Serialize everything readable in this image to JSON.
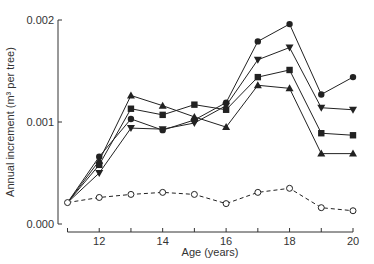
{
  "chart_data": {
    "type": "line",
    "title": "",
    "xlabel": "Age (years)",
    "ylabel": "Annual increment (m³ per tree)",
    "xlim": [
      11,
      20
    ],
    "ylim": [
      0.0,
      0.002
    ],
    "x": [
      11,
      12,
      13,
      14,
      15,
      16,
      17,
      18,
      19,
      20
    ],
    "x_ticks": [
      11,
      12,
      13,
      14,
      15,
      16,
      17,
      18,
      19,
      20
    ],
    "x_tick_labels": [
      "12",
      "14",
      "16",
      "18",
      "20"
    ],
    "y_ticks": [
      0.0,
      0.001,
      0.002
    ],
    "y_tick_labels": [
      "0.000",
      "0.001",
      "0.002"
    ],
    "grid": false,
    "legend": null,
    "series": [
      {
        "name": "filled circle",
        "marker": "circle-filled",
        "line": "solid",
        "values": [
          0.00021,
          0.00066,
          0.00103,
          0.00092,
          0.00102,
          0.00119,
          0.00179,
          0.00196,
          0.00127,
          0.00144
        ]
      },
      {
        "name": "filled triangle down",
        "marker": "triangle-down-filled",
        "line": "solid",
        "values": [
          0.00021,
          0.0005,
          0.00094,
          0.00093,
          0.00099,
          0.00116,
          0.00161,
          0.00173,
          0.00114,
          0.00112
        ]
      },
      {
        "name": "filled square",
        "marker": "square-filled",
        "line": "solid",
        "values": [
          0.00021,
          0.00058,
          0.00113,
          0.00107,
          0.00117,
          0.00112,
          0.00144,
          0.00151,
          0.00089,
          0.00087
        ]
      },
      {
        "name": "filled triangle up",
        "marker": "triangle-up-filled",
        "line": "solid",
        "values": [
          0.00021,
          0.00062,
          0.00126,
          0.00116,
          0.00105,
          0.00095,
          0.00136,
          0.00133,
          0.00069,
          0.00069
        ]
      },
      {
        "name": "open circle",
        "marker": "circle-open",
        "line": "dashed",
        "values": [
          0.00021,
          0.00026,
          0.00029,
          0.00031,
          0.00029,
          0.0002,
          0.00031,
          0.00035,
          0.00016,
          0.00013
        ]
      }
    ]
  },
  "colors": {
    "line": "#222222",
    "axis": "#333333",
    "text": "#333333"
  }
}
